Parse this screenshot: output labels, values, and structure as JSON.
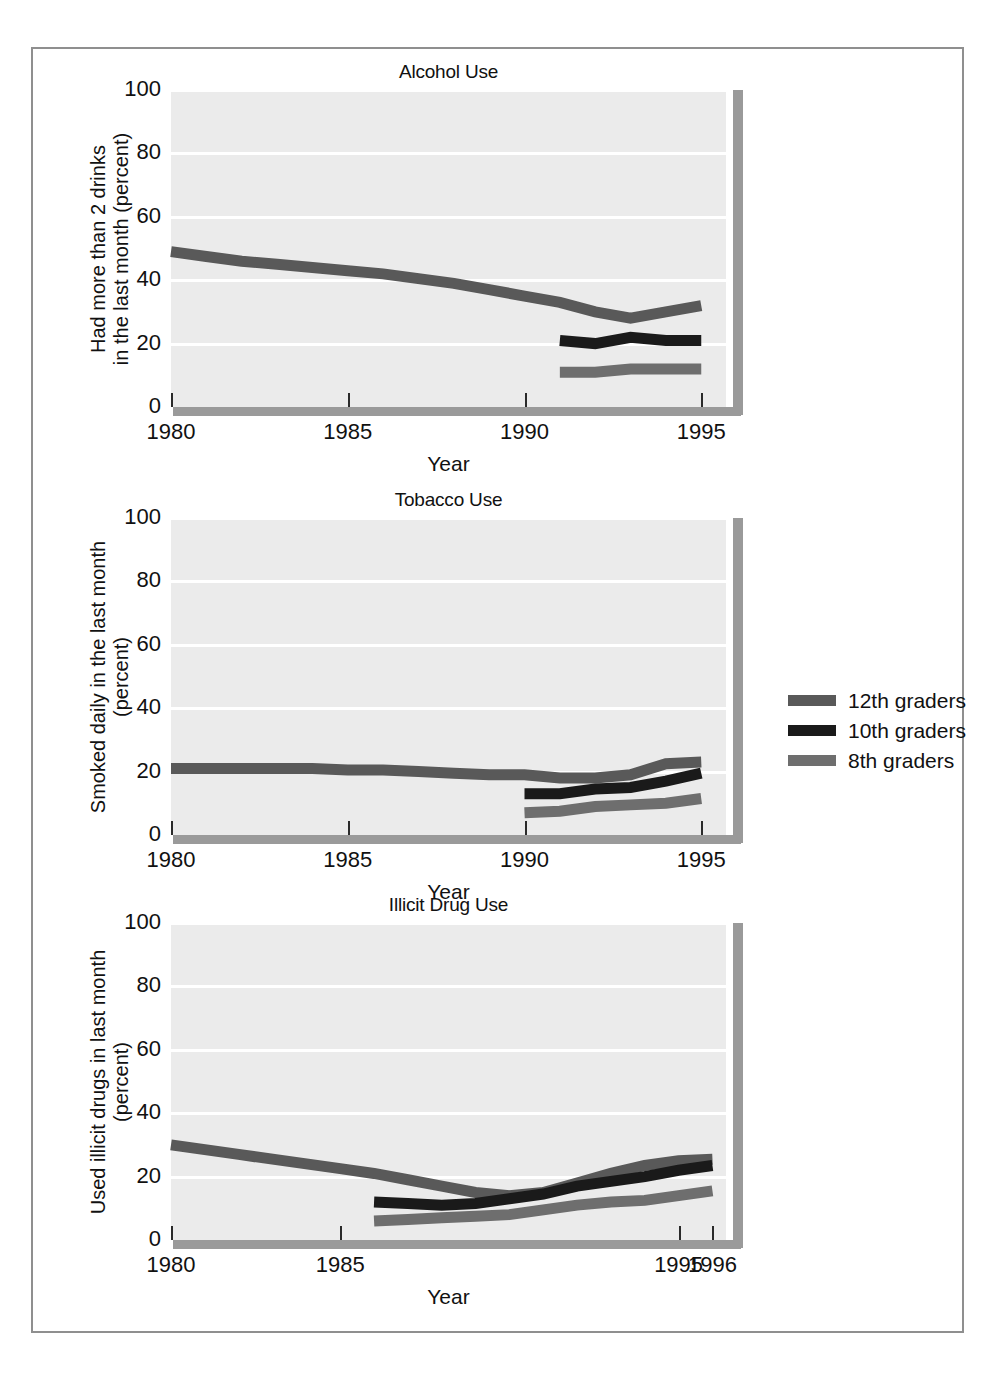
{
  "figure": {
    "border_color": "#8f8f8f",
    "background": "#ffffff"
  },
  "legend": {
    "position": "right-middle",
    "entries": [
      {
        "label": "12th graders",
        "color": "#595959"
      },
      {
        "label": "10th graders",
        "color": "#1a1a1a"
      },
      {
        "label": "8th graders",
        "color": "#6e6e6e"
      }
    ]
  },
  "chart_data": [
    {
      "type": "line",
      "title": "Alcohol Use",
      "xlabel": "Year",
      "ylabel": "Had more than 2 drinks\nin the last month (percent)",
      "ylabel_lines": [
        "Had more than 2 drinks",
        "in the last month (percent)"
      ],
      "xlim": [
        1980,
        1995.7
      ],
      "ylim": [
        0,
        100
      ],
      "yticks": [
        0,
        20,
        40,
        60,
        80,
        100
      ],
      "ytick_labels": [
        "0",
        "20",
        "40",
        "60",
        "80",
        "100"
      ],
      "xticks": [
        1980,
        1985,
        1990,
        1995
      ],
      "xtick_labels": [
        "1980",
        "1985",
        "1990",
        "1995"
      ],
      "grid": "horizontal-white",
      "plot_bg": "#ebebeb",
      "series": [
        {
          "name": "12th graders",
          "color": "#595959",
          "x": [
            1980,
            1981,
            1982,
            1983,
            1984,
            1985,
            1986,
            1987,
            1988,
            1989,
            1990,
            1991,
            1992,
            1993,
            1994,
            1995
          ],
          "values": [
            49,
            47.5,
            46,
            45,
            44,
            43,
            42,
            40.5,
            39,
            37,
            35,
            33,
            30,
            28,
            30,
            32
          ]
        },
        {
          "name": "10th graders",
          "color": "#1a1a1a",
          "x": [
            1991,
            1992,
            1993,
            1994,
            1995
          ],
          "values": [
            21,
            20,
            22,
            21,
            21
          ]
        },
        {
          "name": "8th graders",
          "color": "#6e6e6e",
          "x": [
            1991,
            1992,
            1993,
            1994,
            1995
          ],
          "values": [
            11,
            11,
            12,
            12,
            12
          ]
        }
      ]
    },
    {
      "type": "line",
      "title": "Tobacco Use",
      "xlabel": "Year",
      "ylabel": "Smoked daily in the last month\n(percent)",
      "ylabel_lines": [
        "Smoked daily in the last month",
        "(percent)"
      ],
      "xlim": [
        1980,
        1995.7
      ],
      "ylim": [
        0,
        100
      ],
      "yticks": [
        0,
        20,
        40,
        60,
        80,
        100
      ],
      "ytick_labels": [
        "0",
        "20",
        "40",
        "60",
        "80",
        "100"
      ],
      "xticks": [
        1980,
        1985,
        1990,
        1995
      ],
      "xtick_labels": [
        "1980",
        "1985",
        "1990",
        "1995"
      ],
      "grid": "horizontal-white",
      "plot_bg": "#ebebeb",
      "series": [
        {
          "name": "12th graders",
          "color": "#595959",
          "x": [
            1980,
            1981,
            1982,
            1983,
            1984,
            1985,
            1986,
            1987,
            1988,
            1989,
            1990,
            1991,
            1992,
            1993,
            1994,
            1995
          ],
          "values": [
            21,
            21,
            21,
            21,
            21,
            20.5,
            20.5,
            20,
            19.5,
            19,
            19,
            18,
            18,
            19,
            22.5,
            23
          ]
        },
        {
          "name": "10th graders",
          "color": "#1a1a1a",
          "x": [
            1990,
            1991,
            1992,
            1993,
            1994,
            1995
          ],
          "values": [
            13,
            13,
            14.5,
            15,
            17,
            19.5
          ]
        },
        {
          "name": "8th graders",
          "color": "#6e6e6e",
          "x": [
            1990,
            1991,
            1992,
            1993,
            1994,
            1995
          ],
          "values": [
            7,
            7.5,
            9,
            9.5,
            10,
            11.5
          ]
        }
      ]
    },
    {
      "type": "line",
      "title": "Illicit Drug Use",
      "xlabel": "Year",
      "ylabel": "Used illicit drugs in last month\n(percent)",
      "ylabel_lines": [
        "Used illicit drugs in last month",
        "(percent)"
      ],
      "xlim": [
        1980,
        1996.4
      ],
      "ylim": [
        0,
        100
      ],
      "yticks": [
        0,
        20,
        40,
        60,
        80,
        100
      ],
      "ytick_labels": [
        "0",
        "20",
        "40",
        "60",
        "80",
        "100"
      ],
      "xticks": [
        1980,
        1985,
        1995,
        1996
      ],
      "xtick_labels": [
        "1980",
        "1985",
        "1995",
        "1996"
      ],
      "grid": "horizontal-white",
      "plot_bg": "#ebebeb",
      "series": [
        {
          "name": "12th graders",
          "color": "#595959",
          "x": [
            1980,
            1981,
            1982,
            1983,
            1984,
            1985,
            1986,
            1987,
            1988,
            1989,
            1990,
            1991,
            1992,
            1993,
            1994,
            1995,
            1996
          ],
          "values": [
            30,
            28.5,
            27,
            25.5,
            24,
            22.5,
            21,
            19,
            17,
            15,
            14,
            15,
            18,
            21,
            23.5,
            25,
            25.5
          ]
        },
        {
          "name": "10th graders",
          "color": "#1a1a1a",
          "x": [
            1986,
            1987,
            1988,
            1989,
            1990,
            1991,
            1992,
            1993,
            1994,
            1995,
            1996
          ],
          "values": [
            12,
            11.5,
            11,
            11.5,
            13,
            14.5,
            17,
            18.5,
            20,
            22,
            23.5
          ]
        },
        {
          "name": "8th graders",
          "color": "#6e6e6e",
          "x": [
            1986,
            1987,
            1988,
            1989,
            1990,
            1991,
            1992,
            1993,
            1994,
            1995,
            1996
          ],
          "values": [
            6,
            6.5,
            7,
            7.5,
            8,
            9.5,
            11,
            12,
            12.5,
            14,
            15.5
          ]
        }
      ]
    }
  ]
}
